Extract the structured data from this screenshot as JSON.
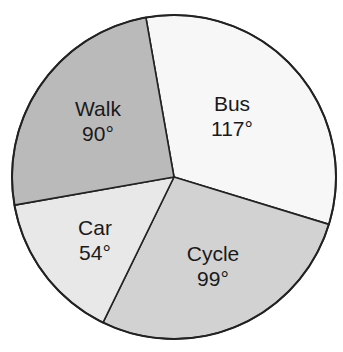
{
  "chart_data": {
    "type": "pie",
    "title": "",
    "unit": "degrees",
    "start_angle_deg": -10,
    "direction": "clockwise",
    "slices": [
      {
        "label": "Bus",
        "value": 117,
        "display": "117°",
        "color": "#f7f7f7"
      },
      {
        "label": "Cycle",
        "value": 99,
        "display": "99°",
        "color": "#d2d2d2"
      },
      {
        "label": "Car",
        "value": 54,
        "display": "54°",
        "color": "#e8e8e8"
      },
      {
        "label": "Walk",
        "value": 90,
        "display": "90°",
        "color": "#bababa"
      }
    ],
    "categories": [
      "Bus",
      "Cycle",
      "Car",
      "Walk"
    ],
    "values": [
      117,
      99,
      54,
      90
    ]
  }
}
